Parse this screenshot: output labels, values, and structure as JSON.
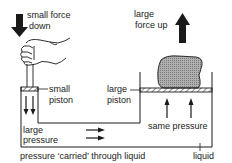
{
  "diagram": {
    "colors": {
      "ink": "#1a1a1a",
      "load": "#9a9a9a",
      "background": "#ffffff"
    },
    "labels": {
      "small_force_line1": "small force",
      "small_force_line2": "down",
      "large_force_line1": "large",
      "large_force_line2": "force up",
      "small_piston_line1": "small",
      "small_piston_line2": "piston",
      "large_piston_line1": "large",
      "large_piston_line2": "piston",
      "large_pressure_line1": "large",
      "large_pressure_line2": "pressure",
      "same_pressure": "same pressure",
      "carried": "pressure ‘carried’ through liquid",
      "liquid": "liquid"
    },
    "icons": {
      "hand": "hand-pushing-icon",
      "down_arrow": "arrow-down-icon",
      "up_arrow": "arrow-up-icon",
      "load": "load-block-icon"
    }
  }
}
